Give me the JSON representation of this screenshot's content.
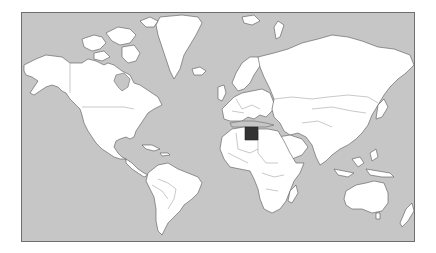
{
  "map": {
    "projection": "mercator",
    "ocean_color": "#c6c6c6",
    "land_color": "#ffffff",
    "border_color": "#555555",
    "highlight_color": "#333333",
    "highlighted_country": "Egypt"
  }
}
